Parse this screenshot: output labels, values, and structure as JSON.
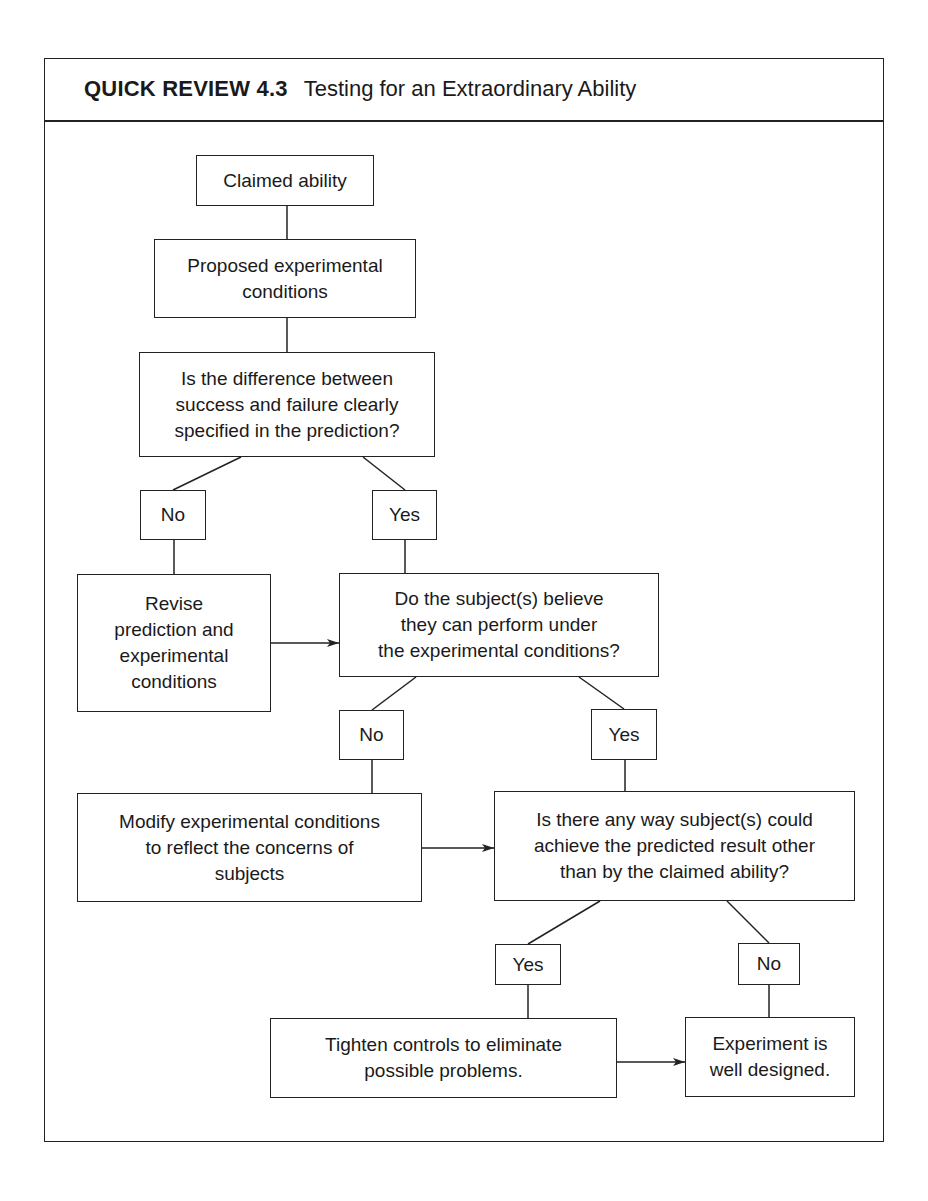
{
  "header": {
    "tag": "QUICK REVIEW 4.3",
    "title": "Testing for an Extraordinary Ability"
  },
  "nodes": {
    "claimed": "Claimed ability",
    "proposed": "Proposed experimental\nconditions",
    "q1": "Is the difference between\nsuccess and failure clearly\nspecified in the prediction?",
    "q1_no": "No",
    "q1_yes": "Yes",
    "revise": "Revise\nprediction and\nexperimental\nconditions",
    "q2": "Do the subject(s) believe\nthey can perform under\nthe experimental conditions?",
    "q2_no": "No",
    "q2_yes": "Yes",
    "modify": "Modify experimental conditions\nto reflect the concerns of\nsubjects",
    "q3": "Is there any way subject(s) could\nachieve the predicted result other\nthan by the claimed ability?",
    "q3_yes": "Yes",
    "q3_no": "No",
    "tighten": "Tighten controls to eliminate\npossible problems.",
    "experiment": "Experiment is\nwell designed."
  },
  "colors": {
    "line": "#222222",
    "background": "#ffffff",
    "text": "#1a1a1a"
  }
}
